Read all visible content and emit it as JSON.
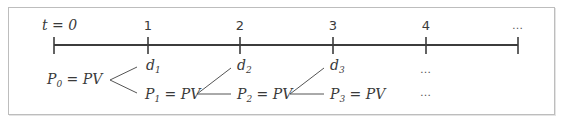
{
  "diagram": {
    "type": "timeline",
    "axis": {
      "ticks": [
        {
          "label": "t = 0",
          "x": 54
        },
        {
          "label": "1",
          "x": 148
        },
        {
          "label": "2",
          "x": 240
        },
        {
          "label": "3",
          "x": 333
        },
        {
          "label": "4",
          "x": 426
        },
        {
          "label": "…",
          "x": 518
        }
      ]
    },
    "nodes": {
      "p0": {
        "main": "P",
        "sub": "0",
        "rest": " = PV"
      },
      "d1": {
        "main": "d",
        "sub": "1"
      },
      "p1": {
        "main": "P",
        "sub": "1",
        "rest": " = PV"
      },
      "d2": {
        "main": "d",
        "sub": "2"
      },
      "p2": {
        "main": "P",
        "sub": "2",
        "rest": " = PV"
      },
      "d3": {
        "main": "d",
        "sub": "3"
      },
      "p3": {
        "main": "P",
        "sub": "3",
        "rest": " = PV"
      },
      "ellipsis_top": "…",
      "ellipsis_bottom": "…"
    },
    "colors": {
      "line": "#3c3c3c",
      "text": "#3a3a3a",
      "border": "#bdbdbd"
    }
  }
}
